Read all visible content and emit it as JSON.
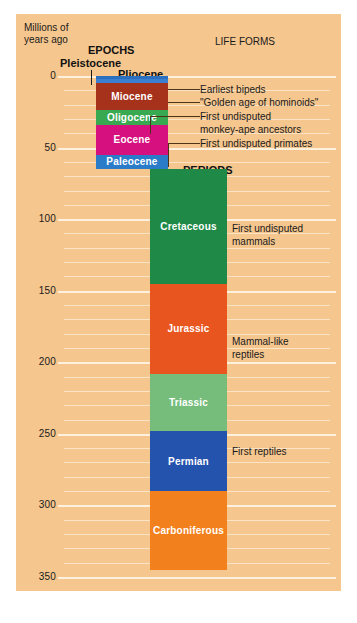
{
  "figure": {
    "axis_title": "Millions of\nyears ago",
    "epochs_header": "EPOCHS",
    "periods_header": "PERIODS",
    "life_forms_header": "LIFE FORMS",
    "pleistocene_callout": "Pleistocene",
    "pliocene_callout": "Pliocene"
  },
  "chart_data": {
    "type": "bar",
    "ylabel": "Millions of years ago",
    "ylim": [
      0,
      350
    ],
    "y_inverted": true,
    "grid": true,
    "gridline_interval": 10,
    "tick_labels": [
      "0",
      "50",
      "100",
      "150",
      "200",
      "250",
      "300",
      "350"
    ],
    "tick_values": [
      0,
      50,
      100,
      150,
      200,
      250,
      300,
      350
    ],
    "legend_position": "none",
    "series": [
      {
        "name": "EPOCHS",
        "values": [
          {
            "label": "Pleistocene",
            "start": 0,
            "end": 2,
            "color": "#2a6fc0",
            "label_shown": false
          },
          {
            "label": "Pliocene",
            "start": 2,
            "end": 5,
            "color": "#3b7fd1",
            "label_shown": false
          },
          {
            "label": "Miocene",
            "start": 5,
            "end": 24,
            "color": "#a6321b",
            "label_shown": true
          },
          {
            "label": "Oligocene",
            "start": 24,
            "end": 34,
            "color": "#38a851",
            "label_shown": true
          },
          {
            "label": "Eocene",
            "start": 34,
            "end": 55,
            "color": "#d6117f",
            "label_shown": true
          },
          {
            "label": "Paleocene",
            "start": 55,
            "end": 65,
            "color": "#2a7bc8",
            "label_shown": true
          }
        ]
      },
      {
        "name": "PERIODS",
        "values": [
          {
            "label": "Cretaceous",
            "start": 65,
            "end": 145,
            "color": "#1f8a48",
            "label_shown": true
          },
          {
            "label": "Jurassic",
            "start": 145,
            "end": 208,
            "color": "#e8551f",
            "label_shown": true
          },
          {
            "label": "Triassic",
            "start": 208,
            "end": 248,
            "color": "#76bd7c",
            "label_shown": true
          },
          {
            "label": "Permian",
            "start": 248,
            "end": 290,
            "color": "#2453ad",
            "label_shown": true
          },
          {
            "label": "Carboniferous",
            "start": 290,
            "end": 345,
            "color": "#f2811d",
            "label_shown": true
          }
        ]
      }
    ],
    "annotations": [
      {
        "text": "Earliest bipeds",
        "points_to": "Pliocene",
        "at_my": 5
      },
      {
        "text": "\"Golden age of hominoids\"",
        "points_to": "Miocene",
        "at_my": 15
      },
      {
        "text": "First undisputed\nmonkey-ape ancestors",
        "points_to": "Oligocene",
        "at_my": 30
      },
      {
        "text": "First undisputed primates",
        "points_to": "Paleocene",
        "at_my": 60
      },
      {
        "text": "First undisputed\nmammals",
        "points_to": "Triassic",
        "at_my": 210
      },
      {
        "text": "Mammal-like\nreptiles",
        "points_to": "Permian",
        "at_my": 262
      },
      {
        "text": "First reptiles",
        "points_to": "Carboniferous",
        "at_my": 312
      }
    ]
  },
  "colors": {
    "panel_background": "#f5c68e",
    "gridline": "#fbe3c4",
    "gridline_major": "#fdf0dd",
    "text": "#1a1a1a",
    "leader_line": "#4a3318"
  }
}
